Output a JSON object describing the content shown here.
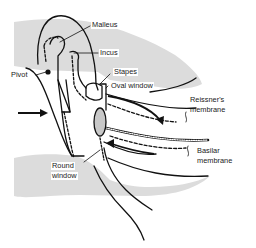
{
  "figure": {
    "colors": {
      "line": "#111111",
      "shade": "#dcdcdc",
      "background": "#ffffff"
    },
    "labels": {
      "malleus": "Malleus",
      "incus": "Incus",
      "pivot": "Pivot",
      "stapes": "Stapes",
      "oval_window": "Oval window",
      "reissners_membrane_line1": "Reissner's",
      "reissners_membrane_line2": "membrane",
      "basilar_membrane_line1": "Basilar",
      "basilar_membrane_line2": "membrane",
      "round_window_line1": "Round",
      "round_window_line2": "window"
    },
    "icons": [
      "input-arrow-icon",
      "fluid-flow-arrow-icon",
      "return-flow-arrow-icon"
    ]
  }
}
